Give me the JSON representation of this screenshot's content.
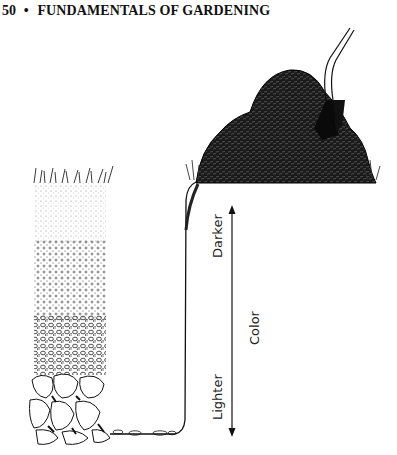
{
  "header": {
    "page_number": "50",
    "separator": "•",
    "running_title": "FUNDAMENTALS OF GARDENING"
  },
  "figure": {
    "labels": {
      "top": "Darker",
      "axis": "Color",
      "bottom": "Lighter"
    }
  }
}
